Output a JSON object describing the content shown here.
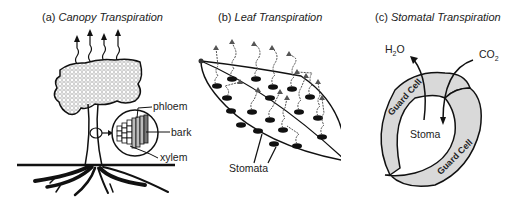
{
  "panels": {
    "a": {
      "prefix": "(a)",
      "title": "Canopy Transpiration",
      "labels": {
        "phloem": "phloem",
        "bark": "bark",
        "xylem": "xylem"
      }
    },
    "b": {
      "prefix": "(b)",
      "title": "Leaf Transpiration",
      "labels": {
        "stomata": "Stomata"
      }
    },
    "c": {
      "prefix": "(c)",
      "title": "Stomatal Transpiration",
      "labels": {
        "h2o": "H",
        "h2o_sub": "2",
        "h2o_end": "O",
        "co2": "CO",
        "co2_sub": "2",
        "stoma": "Stoma",
        "guard_cell_1": "Guard Cell",
        "guard_cell_2": "Guard Cell"
      }
    }
  },
  "colors": {
    "ink": "#111111",
    "fill_gray": "#d9d9d9",
    "canopy_pattern": "#cfcfcf"
  }
}
